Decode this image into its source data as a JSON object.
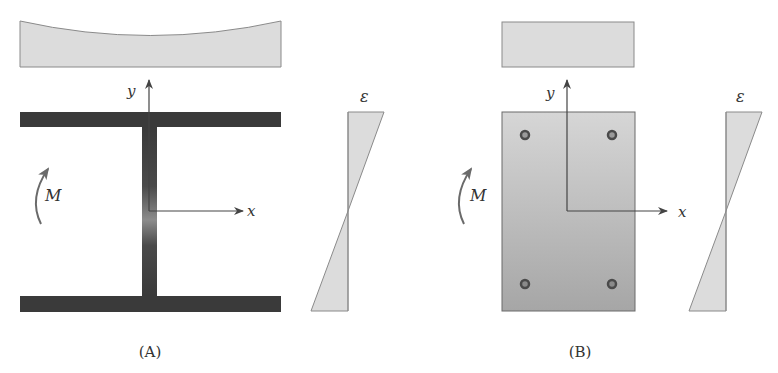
{
  "colors": {
    "stress_fill": "#dcdcdc",
    "stress_stroke": "#8a8a8a",
    "steel": "#3a3a3a",
    "axis": "#444444",
    "moment_arrow": "#6a6a6a",
    "concrete_top": "#d6d6d6",
    "concrete_bottom": "#a6a6a6",
    "rebar": "#4a4a4a"
  },
  "panel_a": {
    "caption": "(A)",
    "section_type": "steel I-beam",
    "y_axis_label": "y",
    "x_axis_label": "x",
    "moment_label": "M",
    "strain_label": "ε"
  },
  "panel_b": {
    "caption": "(B)",
    "section_type": "reinforced concrete rectangular section",
    "y_axis_label": "y",
    "x_axis_label": "x",
    "moment_label": "M",
    "strain_label": "ε",
    "rebar_count": 4
  }
}
